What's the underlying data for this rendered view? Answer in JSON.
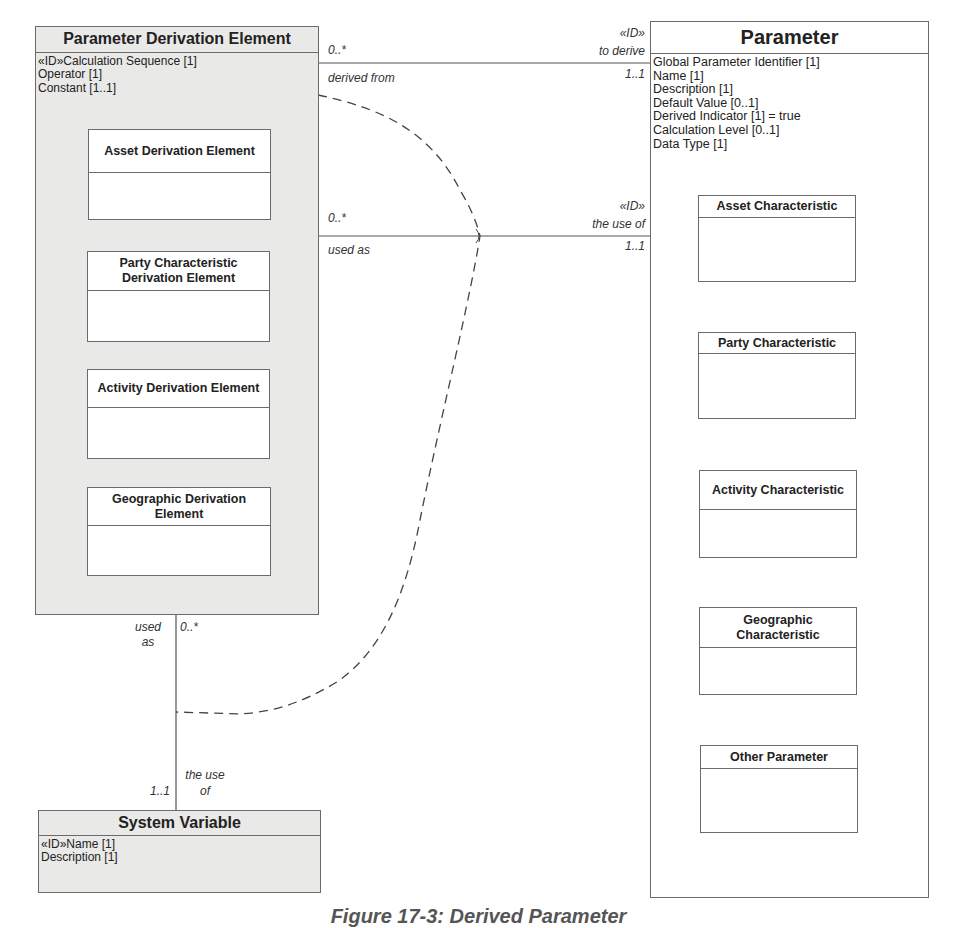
{
  "diagram": {
    "type": "UML class diagram",
    "caption": "Figure 17-3: Derived Parameter"
  },
  "classes": {
    "parameter_derivation_element": {
      "name": "Parameter Derivation Element",
      "attributes": [
        "«ID»Calculation Sequence [1]",
        "Operator [1]",
        "Constant [1..1]"
      ],
      "subclasses": [
        {
          "name": "Asset Derivation Element"
        },
        {
          "name": "Party Characteristic Derivation Element"
        },
        {
          "name": "Activity Derivation Element"
        },
        {
          "name": "Geographic Derivation Element"
        }
      ]
    },
    "parameter": {
      "name": "Parameter",
      "attributes": [
        "Global Parameter Identifier [1]",
        "Name [1]",
        "Description [1]",
        "Default Value [0..1]",
        "Derived Indicator [1] = true",
        "Calculation Level [0..1]",
        "Data Type [1]"
      ],
      "subclasses": [
        {
          "name": "Asset Characteristic"
        },
        {
          "name": "Party Characteristic"
        },
        {
          "name": "Activity Characteristic"
        },
        {
          "name": "Geographic Characteristic"
        },
        {
          "name": "Other Parameter"
        }
      ]
    },
    "system_variable": {
      "name": "System Variable",
      "attributes": [
        "«ID»Name [1]",
        "Description [1]"
      ]
    }
  },
  "associations": {
    "derive": {
      "source_multiplicity": "0..*",
      "source_role": "derived from",
      "target_stereotype": "«ID»",
      "target_role": "to derive",
      "target_multiplicity": "1..1"
    },
    "use_parameter": {
      "source_multiplicity": "0..*",
      "source_role": "used as",
      "target_stereotype": "«ID»",
      "target_role": "the use of",
      "target_multiplicity": "1..1"
    },
    "use_system_variable": {
      "source_role_line1": "used",
      "source_role_line2": "as",
      "source_multiplicity": "0..*",
      "target_role_line1": "the use",
      "target_role_line2": "of",
      "target_multiplicity": "1..1"
    }
  },
  "colors": {
    "gray_class_fill": "#e9e9e7",
    "white_class_fill": "#ffffff",
    "line": "#555555",
    "generalization_line": "#9a9a9a"
  }
}
